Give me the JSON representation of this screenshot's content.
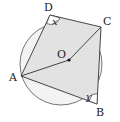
{
  "diagram": {
    "points": {
      "A": "A",
      "B": "B",
      "C": "C",
      "D": "D",
      "O": "O"
    },
    "angles": {
      "at_D": "x",
      "at_B": "y"
    },
    "segments": [
      "DC",
      "CB",
      "BA",
      "AD",
      "AO",
      "OC"
    ],
    "colors": {
      "circle_fill": "#f3f3f3",
      "quad_fill": "#e2e2e2",
      "stroke": "#333333",
      "angle_fill": "#ffffff"
    }
  }
}
